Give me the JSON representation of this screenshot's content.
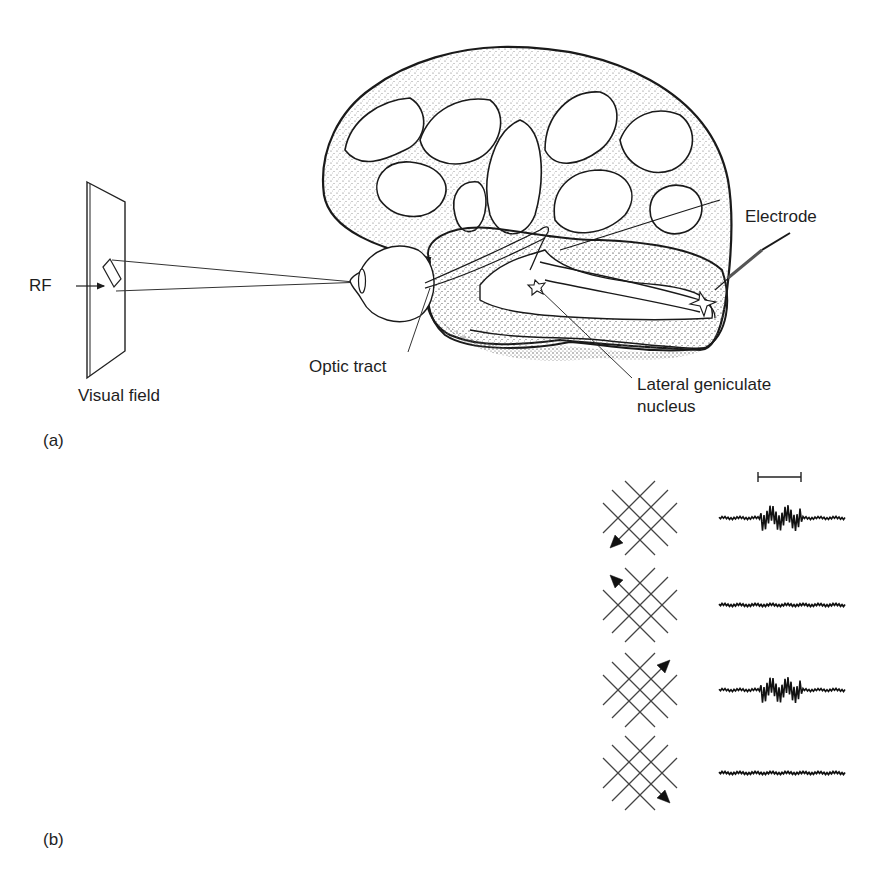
{
  "figure": {
    "panel_a": {
      "label": "(a)",
      "labels": {
        "rf": "RF",
        "visual_field": "Visual field",
        "optic_tract": "Optic tract",
        "lgn_line1": "Lateral geniculate",
        "lgn_line2": "nucleus",
        "electrode": "Electrode"
      }
    },
    "panel_b": {
      "label": "(b)",
      "scale_bar": "stimulus duration bar",
      "rows": [
        {
          "motion_direction": "down-left",
          "response": "strong burst"
        },
        {
          "motion_direction": "up-left",
          "response": "none"
        },
        {
          "motion_direction": "up-right",
          "response": "strong burst"
        },
        {
          "motion_direction": "down-right",
          "response": "none"
        }
      ]
    },
    "colors": {
      "ink": "#1e1e1e",
      "stipple": "#8a8a8a",
      "background": "#ffffff"
    }
  }
}
